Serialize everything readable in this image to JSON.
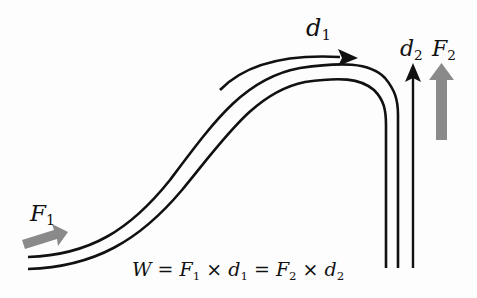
{
  "diagram": {
    "labels": {
      "F1": {
        "base": "F",
        "sub": "1"
      },
      "d1": {
        "base": "d",
        "sub": "1"
      },
      "d2": {
        "base": "d",
        "sub": "2"
      },
      "F2": {
        "base": "F",
        "sub": "2"
      }
    },
    "equation": {
      "W": "W",
      "eq1": " = ",
      "F1_base": "F",
      "F1_sub": "1",
      "times1": " × ",
      "d1_base": "d",
      "d1_sub": "1",
      "eq2": " = ",
      "F2_base": "F",
      "F2_sub": "2",
      "times2": " × ",
      "d2_base": "d",
      "d2_sub": "2"
    },
    "colors": {
      "track": "#111111",
      "force_arrow": "#8a8a8a",
      "background": "#fdfdfd"
    }
  }
}
